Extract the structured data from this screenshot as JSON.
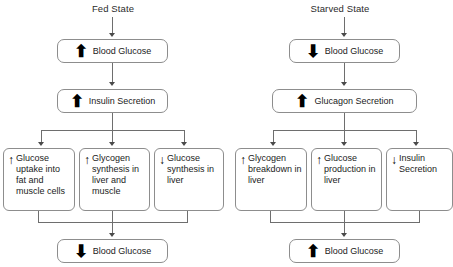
{
  "diagram": {
    "icons": {
      "up": "↑",
      "down": "↓",
      "up_bold": "⬆",
      "down_bold": "⬇"
    },
    "columns": [
      {
        "id": "fed",
        "heading": "Fed State",
        "step1": {
          "arrow": "⬆",
          "direction": "up",
          "label": "Blood Glucose"
        },
        "step2": {
          "arrow": "⬆",
          "direction": "up",
          "label": "Insulin Secretion"
        },
        "branches": [
          {
            "arrow": "↑",
            "direction": "up",
            "label": "Glucose uptake into fat and muscle cells"
          },
          {
            "arrow": "↑",
            "direction": "up",
            "label": "Glycogen synthesis in liver and muscle"
          },
          {
            "arrow": "↓",
            "direction": "down",
            "label": "Glucose synthesis in liver"
          }
        ],
        "result": {
          "arrow": "⬇",
          "direction": "down",
          "label": "Blood Glucose"
        }
      },
      {
        "id": "starved",
        "heading": "Starved State",
        "step1": {
          "arrow": "⬇",
          "direction": "down",
          "label": "Blood Glucose"
        },
        "step2": {
          "arrow": "⬆",
          "direction": "up",
          "label": "Glucagon Secretion"
        },
        "branches": [
          {
            "arrow": "↑",
            "direction": "up",
            "label": "Glycogen breakdown in liver"
          },
          {
            "arrow": "↑",
            "direction": "up",
            "label": "Glucose production in liver"
          },
          {
            "arrow": "↓",
            "direction": "down",
            "label": "Insulin Secretion"
          }
        ],
        "result": {
          "arrow": "⬆",
          "direction": "up",
          "label": "Blood Glucose"
        }
      }
    ],
    "colors": {
      "box_border": "#8d8d8d",
      "connector": "#6e6e6e",
      "text": "#1b1b1b",
      "background": "#ffffff"
    }
  }
}
